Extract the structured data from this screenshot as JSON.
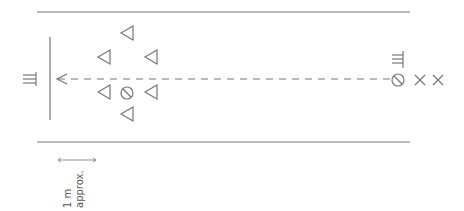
{
  "diagram": {
    "type": "field-layout",
    "colors": {
      "stroke": "#777777",
      "text": "#555555",
      "background": "#ffffff"
    },
    "boundaries": {
      "top_line_y": 12,
      "bottom_line_y": 142,
      "x_start": 37,
      "x_end": 410
    },
    "goal_line": {
      "x": 50,
      "y1": 37,
      "y2": 120
    },
    "arrow": {
      "from_x": 390,
      "to_x": 57,
      "y": 79,
      "style": "dashed",
      "head": "left"
    },
    "left_marker": {
      "symbol": "comb-icon",
      "x": 26,
      "y": 79
    },
    "right_marker": {
      "symbol": "comb-icon",
      "x": 398,
      "y": 59
    },
    "triangles": [
      {
        "x": 127,
        "y": 33
      },
      {
        "x": 104,
        "y": 57
      },
      {
        "x": 151,
        "y": 57
      },
      {
        "x": 104,
        "y": 92
      },
      {
        "x": 151,
        "y": 92
      },
      {
        "x": 127,
        "y": 114
      }
    ],
    "circles": [
      {
        "x": 127,
        "y": 93
      },
      {
        "x": 398,
        "y": 80
      }
    ],
    "crosses": [
      {
        "x": 420,
        "y": 80
      },
      {
        "x": 438,
        "y": 80
      }
    ],
    "scale": {
      "x1": 58,
      "x2": 96,
      "y": 160,
      "label_line1": "1 m",
      "label_line2": "approx."
    }
  }
}
